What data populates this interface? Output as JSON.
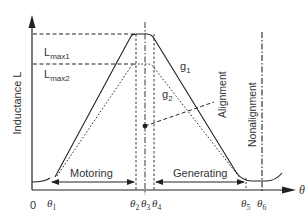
{
  "diagram": {
    "type": "inductance-profile",
    "y_axis": {
      "label": "Inductance L"
    },
    "x_axis": {
      "label": "θ",
      "origin": "0"
    },
    "levels": [
      {
        "name": "L_max1",
        "main": "L",
        "sub": "max1"
      },
      {
        "name": "L_max2",
        "main": "L",
        "sub": "max2"
      }
    ],
    "angles": [
      {
        "main": "θ",
        "sub": "1"
      },
      {
        "main": "θ",
        "sub": "2"
      },
      {
        "main": "θ",
        "sub": "3"
      },
      {
        "main": "θ",
        "sub": "4"
      },
      {
        "main": "θ",
        "sub": "5"
      },
      {
        "main": "θ",
        "sub": "6"
      }
    ],
    "curves": [
      {
        "main": "g",
        "sub": "1",
        "style": "solid"
      },
      {
        "main": "g",
        "sub": "2",
        "style": "dotted"
      }
    ],
    "regions": {
      "motoring": "Motoring",
      "generating": "Generating"
    },
    "annotations": {
      "alignment": "Alignment",
      "nonalignment": "Nonalignment"
    },
    "colors": {
      "line": "#222222",
      "text": "#333333",
      "background": "#ffffff"
    }
  }
}
